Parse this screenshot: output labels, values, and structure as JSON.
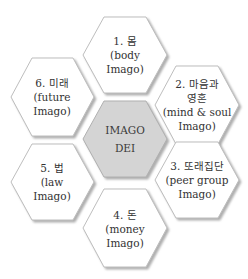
{
  "diagram": {
    "center": {
      "line1": "IMAGO",
      "line2": "DEI",
      "fill": "#d4d4d4"
    },
    "nodes": [
      {
        "id": "body",
        "lines": [
          "1. 몸",
          "(body",
          "Imago)"
        ]
      },
      {
        "id": "mind-soul",
        "lines": [
          "2. 마음과",
          "영혼",
          "(mind & soul",
          "Imago)"
        ]
      },
      {
        "id": "peer-group",
        "lines": [
          "3. 또래집단",
          "(peer group",
          "Imago)"
        ]
      },
      {
        "id": "money",
        "lines": [
          "4. 돈",
          "(money",
          "Imago)"
        ]
      },
      {
        "id": "law",
        "lines": [
          "5. 법",
          "(law",
          "Imago)"
        ]
      },
      {
        "id": "future",
        "lines": [
          "6. 미래",
          "(future",
          "Imago)"
        ]
      }
    ],
    "colors": {
      "hex_fill": "#ffffff",
      "hex_stroke": "#b8b8b8",
      "shadow": "#a8a8a8"
    }
  }
}
